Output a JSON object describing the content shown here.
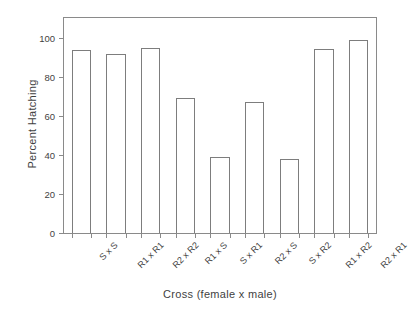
{
  "chart_data": {
    "type": "bar",
    "title": "",
    "xlabel": "Cross (female x male)",
    "ylabel": "Percent Hatching",
    "categories": [
      "S x S",
      "R1 x R1",
      "R2 x R2",
      "R1 x S",
      "S x R1",
      "R2 x S",
      "S x R2",
      "R1 x R2",
      "R2 x R1"
    ],
    "values": [
      93.5,
      91.5,
      94.5,
      69,
      39,
      67,
      38,
      94,
      99
    ],
    "ylim": [
      0,
      110
    ],
    "yticks": [
      0,
      20,
      40,
      60,
      80,
      100
    ],
    "ytick_labels": [
      "0",
      "20",
      "40",
      "60",
      "80",
      "100"
    ],
    "grid": false,
    "legend": "none",
    "bar_fill_color": "#ffffff",
    "bar_edge_color": "#7d7d7d",
    "axis_color": "#8a8a8a",
    "text_color": "#3f3f3f",
    "background_color": "#ffffff"
  }
}
